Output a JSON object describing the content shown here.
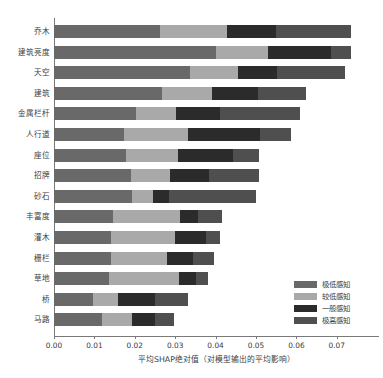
{
  "chart_data": {
    "type": "bar",
    "orientation": "horizontal",
    "stacked": true,
    "title": "",
    "xlabel": "平均SHAP绝对值（对模型输出的平均影响）",
    "ylabel": "",
    "xlim": [
      0.0,
      0.0785
    ],
    "grid": false,
    "legend_position": "lower-right",
    "xticks": [
      "0.00",
      "0.01",
      "0.02",
      "0.03",
      "0.04",
      "0.05",
      "0.06",
      "0.07"
    ],
    "xtick_values": [
      0.0,
      0.01,
      0.02,
      0.03,
      0.04,
      0.05,
      0.06,
      0.07
    ],
    "categories": [
      "乔木",
      "建筑亮度",
      "天空",
      "建筑",
      "金属栏杆",
      "人行道",
      "座位",
      "招牌",
      "砂石",
      "丰富度",
      "灌木",
      "栅栏",
      "草地",
      "桥",
      "马路"
    ],
    "series": [
      {
        "name": "极低感知",
        "color": "#696969",
        "values": [
          0.0262,
          0.04,
          0.0337,
          0.0268,
          0.0203,
          0.0173,
          0.0177,
          0.019,
          0.0192,
          0.0146,
          0.0141,
          0.014,
          0.0137,
          0.0097,
          0.012
        ]
      },
      {
        "name": "较低感知",
        "color": "#a9a9a9",
        "values": [
          0.0167,
          0.013,
          0.0119,
          0.0123,
          0.0099,
          0.0159,
          0.0129,
          0.0097,
          0.0052,
          0.0165,
          0.0159,
          0.0139,
          0.0172,
          0.0062,
          0.0073
        ]
      },
      {
        "name": "一般感知",
        "color": "#2b2b2b",
        "values": [
          0.0121,
          0.0156,
          0.0097,
          0.0113,
          0.0109,
          0.0178,
          0.0136,
          0.0096,
          0.0041,
          0.0045,
          0.0077,
          0.0065,
          0.0043,
          0.0091,
          0.0058
        ]
      },
      {
        "name": "极高感知",
        "color": "#4f4f4f",
        "values": [
          0.0184,
          0.0048,
          0.0167,
          0.0121,
          0.0198,
          0.0076,
          0.0066,
          0.0125,
          0.0216,
          0.0061,
          0.0033,
          0.0051,
          0.003,
          0.0081,
          0.0045
        ]
      }
    ],
    "totals": [
      0.0734,
      0.0734,
      0.072,
      0.0625,
      0.0609,
      0.0586,
      0.0508,
      0.0508,
      0.0501,
      0.0417,
      0.041,
      0.0395,
      0.0382,
      0.0331,
      0.0296
    ]
  },
  "legend": {
    "items": [
      {
        "label": "极低感知",
        "color": "#696969"
      },
      {
        "label": "较低感知",
        "color": "#a9a9a9"
      },
      {
        "label": "一般感知",
        "color": "#2b2b2b"
      },
      {
        "label": "极高感知",
        "color": "#4f4f4f"
      }
    ]
  },
  "axis": {
    "x_title": "平均SHAP绝对值（对模型输出的平均影响）"
  }
}
